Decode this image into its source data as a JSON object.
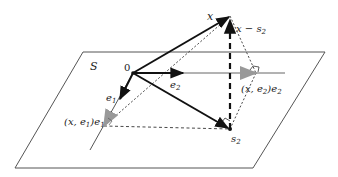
{
  "diagram": {
    "labels": {
      "plane": "S",
      "origin": "0",
      "x": "x",
      "x_minus_s2": "x − s",
      "x_minus_s2_sub": "2",
      "e1": "e",
      "e1_sub": "1",
      "e2": "e",
      "e2_sub": "2",
      "proj_e1": "(x, e",
      "proj_e1_sub": "1",
      "proj_e1_tail": ")e",
      "proj_e1_tail_sub": "1",
      "proj_e2": "(x, e",
      "proj_e2_sub": "2",
      "proj_e2_tail": ")e",
      "proj_e2_tail_sub": "2",
      "s2": "s",
      "s2_sub": "2"
    },
    "colors": {
      "ink": "#1a1a1a",
      "plane_edge": "#555555",
      "axis": "#666666",
      "projection_marker": "#999999"
    }
  }
}
